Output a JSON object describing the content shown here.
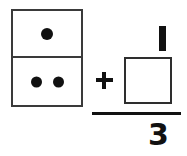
{
  "page": {
    "background_color": "#ffffff",
    "ink_color": "#111111",
    "outline_color": "#3a3a3a"
  },
  "domino": {
    "name": "domino-tile",
    "top_half": {
      "pip_count": 1,
      "pips": [
        "pip"
      ]
    },
    "bottom_half": {
      "pip_count": 2,
      "pips": [
        "pip",
        "pip"
      ]
    },
    "total_pips": 3
  },
  "operator": {
    "symbol": "+",
    "name": "plus-operator"
  },
  "fraction": {
    "numerator": "1",
    "denominator": "3",
    "bar": "—"
  },
  "answer_box": {
    "value": "",
    "placeholder": ""
  }
}
